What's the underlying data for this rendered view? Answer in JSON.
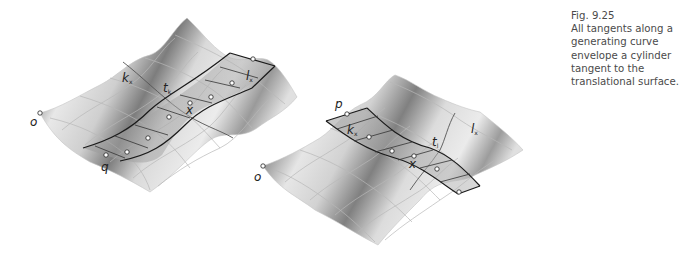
{
  "caption": {
    "number": "Fig. 9.25",
    "text": "All tangents along a generating curve envelope a cylinder tangent to the translational surface."
  },
  "left_figure": {
    "labels": {
      "o": "o",
      "q": "q",
      "k": "k",
      "k_sub": "x",
      "t": "t",
      "t_sub": "k",
      "l": "l",
      "l_sub": "x",
      "x": "x"
    }
  },
  "right_figure": {
    "labels": {
      "o": "o",
      "p": "p",
      "k": "k",
      "k_sub": "x",
      "t": "t",
      "t_sub": "l",
      "l": "l",
      "l_sub": "x",
      "x": "x"
    }
  },
  "colors": {
    "surface_light": "#e6e6e6",
    "surface_dark": "#8a8a8a",
    "grid_line": "#b5b5b5",
    "curve": "#1a1a1a",
    "caption_text": "#4a4a4a"
  }
}
